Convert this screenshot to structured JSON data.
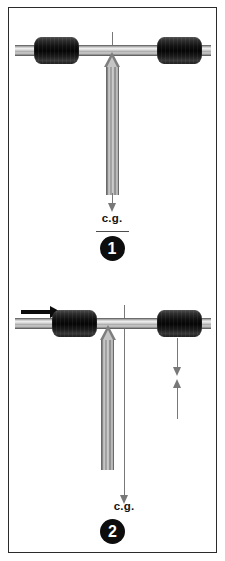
{
  "page": {
    "background_color": "#ffffff",
    "border_color": "#2b2b2b",
    "width": 225,
    "height": 561
  },
  "palette": {
    "weight_dark": "#0d0d0d",
    "bar_metal_light": "#efefef",
    "bar_metal_dark": "#4a4a4a",
    "shaft_metal": "#b4b4b4",
    "thin_arrow_gray": "#787878",
    "motion_arrow_black": "#0b0b0b",
    "badge_fill": "#0d0d0d",
    "badge_text": "#ffffff",
    "label_text": "#141414"
  },
  "figures": [
    {
      "id": "figure-1",
      "badge_number": "1",
      "cg_label": "c.g.",
      "has_cg_underline": true,
      "has_motion_arrow": false,
      "has_reaction_arrows": false,
      "shaft_aligned_with_cg_line": true,
      "shaft_has_top_arrowhead": true,
      "shaft_has_bottom_arrowhead": false,
      "weights": [
        {
          "name": "left-weight",
          "position": "left"
        },
        {
          "name": "right-weight",
          "position": "right"
        }
      ]
    },
    {
      "id": "figure-2",
      "badge_number": "2",
      "cg_label": "c.g.",
      "has_cg_underline": false,
      "has_motion_arrow": true,
      "has_reaction_arrows": true,
      "shaft_aligned_with_cg_line": false,
      "shaft_offset_direction": "left",
      "shaft_has_top_arrowhead": true,
      "shaft_has_bottom_arrowhead": false,
      "weights": [
        {
          "name": "left-weight",
          "position": "left"
        },
        {
          "name": "right-weight",
          "position": "right"
        }
      ],
      "reaction_arrows": [
        {
          "name": "down-arrow",
          "direction": "down"
        },
        {
          "name": "up-arrow",
          "direction": "up"
        }
      ],
      "motion_arrow": {
        "name": "motion-arrow",
        "direction": "right"
      }
    }
  ]
}
